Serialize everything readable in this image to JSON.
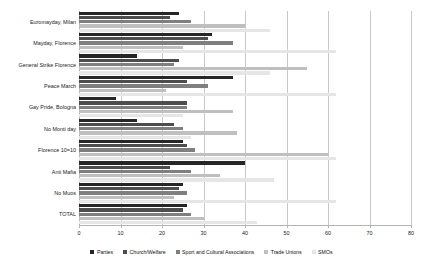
{
  "chart_data": {
    "type": "bar",
    "orientation": "horizontal",
    "title": "",
    "xlabel": "",
    "ylabel": "",
    "xlim": [
      0,
      80
    ],
    "xticks": [
      0,
      10,
      20,
      30,
      40,
      50,
      60,
      70,
      80
    ],
    "grid": true,
    "legend_position": "bottom",
    "categories": [
      "Euromayday, Milan",
      "Mayday, Florence",
      "General Strike  Florence",
      "Peace March",
      "Gay Pride, Bologna",
      "No Monti day",
      "Florence 10=10",
      "Anti Mafia",
      "No Muos",
      "TOTAL"
    ],
    "series": [
      {
        "name": "Parties",
        "color": "#262626",
        "values": [
          24,
          32,
          14,
          37,
          9,
          14,
          25,
          40,
          25,
          26
        ]
      },
      {
        "name": "Church/Welfare",
        "color": "#4d4d4d",
        "values": [
          22,
          31,
          24,
          26,
          26,
          23,
          26,
          22,
          24,
          25
        ]
      },
      {
        "name": "Sport and Cultural Associations",
        "color": "#7f7f7f",
        "values": [
          27,
          37,
          23,
          31,
          26,
          25,
          28,
          27,
          26,
          27
        ]
      },
      {
        "name": "Trade Unions",
        "color": "#bfbfbf",
        "values": [
          40,
          25,
          55,
          21,
          37,
          38,
          60,
          34,
          23,
          30
        ]
      },
      {
        "name": "SMOs",
        "color": "#e6e6e6",
        "values": [
          46,
          62,
          46,
          62,
          25,
          27,
          62,
          47,
          62,
          43
        ]
      }
    ]
  },
  "legend": {
    "items": [
      {
        "label": "Parties",
        "color": "#262626"
      },
      {
        "label": "Church/Welfare",
        "color": "#4d4d4d"
      },
      {
        "label": "Sport and Cultural Associations",
        "color": "#7f7f7f"
      },
      {
        "label": "Trade Unions",
        "color": "#bfbfbf"
      },
      {
        "label": "SMOs",
        "color": "#e6e6e6"
      }
    ]
  }
}
